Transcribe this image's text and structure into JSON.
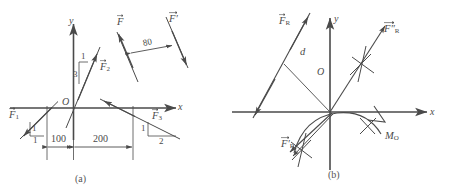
{
  "figure": {
    "type": "engineering-mechanics-free-body-diagram",
    "stroke_color": "#4a4a4a",
    "background": "#ffffff",
    "panels": [
      {
        "id": "a",
        "caption": "(a)",
        "axes": {
          "x_label": "x",
          "y_label": "y",
          "origin_label": "O"
        },
        "forces": [
          {
            "name": "F1",
            "base": "F",
            "subscript": "1",
            "prime": "",
            "slope_rise": "1",
            "slope_run": "1"
          },
          {
            "name": "F2",
            "base": "F",
            "subscript": "2",
            "prime": "",
            "slope_rise": "1",
            "slope_run": "3"
          },
          {
            "name": "F3",
            "base": "F",
            "subscript": "3",
            "prime": "",
            "slope_rise": "1",
            "slope_run": "2"
          },
          {
            "name": "F",
            "base": "F",
            "subscript": "",
            "prime": "",
            "slope_rise": "",
            "slope_run": ""
          },
          {
            "name": "Fprime",
            "base": "F",
            "subscript": "",
            "prime": "′",
            "slope_rise": "",
            "slope_run": ""
          }
        ],
        "couple_distance": "80",
        "dimensions": [
          {
            "label": "100"
          },
          {
            "label": "200"
          }
        ]
      },
      {
        "id": "b",
        "caption": "(b)",
        "axes": {
          "x_label": "x",
          "y_label": "y",
          "origin_label": "O"
        },
        "distance_label": "d",
        "moment_label": "M",
        "moment_subscript": "O",
        "forces": [
          {
            "name": "FR",
            "base": "F",
            "subscript": "R",
            "prime": ""
          },
          {
            "name": "FR-prime",
            "base": "F",
            "subscript": "R",
            "prime": "′"
          },
          {
            "name": "FR-dprime",
            "base": "F",
            "subscript": "R",
            "prime": "″"
          }
        ]
      }
    ]
  },
  "labels": {
    "a": {
      "x_axis": "x",
      "y_axis": "y",
      "origin": "O",
      "f1": "F",
      "f1_sub": "1",
      "f2": "F",
      "f2_sub": "2",
      "f3": "F",
      "f3_sub": "3",
      "f": "F",
      "f_prime": "F",
      "f_prime_mark": "′",
      "couple_dist": "80",
      "dim_100": "100",
      "dim_200": "200",
      "f1_rise": "1",
      "f1_run": "1",
      "f2_rise": "1",
      "f2_run": "3",
      "f3_rise": "1",
      "f3_run": "2",
      "caption": "(a)"
    },
    "b": {
      "x_axis": "x",
      "y_axis": "y",
      "origin": "O",
      "fr": "F",
      "fr_sub": "R",
      "fr_prime": "F",
      "fr_prime_mark": "′",
      "fr_prime_sub": "R",
      "fr_dprime": "F",
      "fr_dprime_mark": "″",
      "fr_dprime_sub": "R",
      "distance": "d",
      "moment": "M",
      "moment_sub": "O",
      "caption": "(b)"
    }
  }
}
